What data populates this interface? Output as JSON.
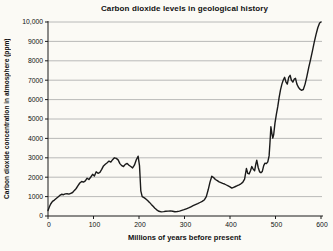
{
  "window": {
    "background": "#fbfaf5"
  },
  "chart_data": {
    "type": "line",
    "title": "Carbon dioxide levels in geological history",
    "xlabel": "Millions of years before present",
    "ylabel": "Carbon dioxide concentration in atmosphere (ppm)",
    "xlim": [
      0,
      600
    ],
    "ylim": [
      0,
      10000
    ],
    "x_ticks": [
      0,
      100,
      200,
      300,
      400,
      500,
      600
    ],
    "x_tick_labels": [
      "0",
      "100",
      "200",
      "300",
      "400",
      "500",
      "600"
    ],
    "y_ticks": [
      0,
      1000,
      2000,
      3000,
      4000,
      5000,
      6000,
      7000,
      8000,
      9000,
      10000
    ],
    "y_tick_labels": [
      "0",
      "1000",
      "2000",
      "3000",
      "4000",
      "5000",
      "6000",
      "7000",
      "8000",
      "9000",
      "10,000"
    ],
    "grid": "horizontal-only",
    "legend": "none",
    "line_color": "#1a1a1a",
    "grid_color": "#a8a8a8",
    "axis_color": "#1a1a1a",
    "text_color": "#111111",
    "series": [
      {
        "name": "CO2 concentration",
        "points": [
          [
            0,
            280
          ],
          [
            3,
            480
          ],
          [
            6,
            620
          ],
          [
            10,
            750
          ],
          [
            14,
            820
          ],
          [
            18,
            900
          ],
          [
            22,
            980
          ],
          [
            26,
            1060
          ],
          [
            30,
            1120
          ],
          [
            34,
            1100
          ],
          [
            38,
            1140
          ],
          [
            42,
            1150
          ],
          [
            46,
            1130
          ],
          [
            50,
            1170
          ],
          [
            54,
            1210
          ],
          [
            58,
            1320
          ],
          [
            62,
            1420
          ],
          [
            66,
            1560
          ],
          [
            70,
            1700
          ],
          [
            74,
            1780
          ],
          [
            78,
            1750
          ],
          [
            82,
            1810
          ],
          [
            86,
            1950
          ],
          [
            90,
            1880
          ],
          [
            94,
            2010
          ],
          [
            98,
            2150
          ],
          [
            102,
            2060
          ],
          [
            106,
            2280
          ],
          [
            110,
            2200
          ],
          [
            114,
            2250
          ],
          [
            118,
            2400
          ],
          [
            122,
            2580
          ],
          [
            126,
            2670
          ],
          [
            130,
            2750
          ],
          [
            134,
            2830
          ],
          [
            138,
            2780
          ],
          [
            142,
            2900
          ],
          [
            146,
            3000
          ],
          [
            150,
            2970
          ],
          [
            154,
            2890
          ],
          [
            158,
            2700
          ],
          [
            162,
            2600
          ],
          [
            166,
            2550
          ],
          [
            170,
            2660
          ],
          [
            174,
            2710
          ],
          [
            178,
            2620
          ],
          [
            182,
            2550
          ],
          [
            186,
            2480
          ],
          [
            190,
            2620
          ],
          [
            194,
            2900
          ],
          [
            198,
            3080
          ],
          [
            201,
            2600
          ],
          [
            204,
            1300
          ],
          [
            207,
            1000
          ],
          [
            211,
            950
          ],
          [
            215,
            880
          ],
          [
            219,
            800
          ],
          [
            223,
            700
          ],
          [
            227,
            600
          ],
          [
            231,
            500
          ],
          [
            235,
            400
          ],
          [
            239,
            320
          ],
          [
            244,
            240
          ],
          [
            249,
            210
          ],
          [
            254,
            225
          ],
          [
            259,
            245
          ],
          [
            264,
            255
          ],
          [
            269,
            265
          ],
          [
            274,
            245
          ],
          [
            279,
            220
          ],
          [
            284,
            230
          ],
          [
            289,
            255
          ],
          [
            294,
            290
          ],
          [
            299,
            325
          ],
          [
            304,
            370
          ],
          [
            309,
            420
          ],
          [
            314,
            475
          ],
          [
            319,
            530
          ],
          [
            324,
            580
          ],
          [
            329,
            635
          ],
          [
            334,
            695
          ],
          [
            339,
            755
          ],
          [
            344,
            840
          ],
          [
            348,
            1000
          ],
          [
            352,
            1350
          ],
          [
            356,
            1750
          ],
          [
            360,
            2050
          ],
          [
            364,
            1980
          ],
          [
            368,
            1880
          ],
          [
            372,
            1820
          ],
          [
            376,
            1760
          ],
          [
            380,
            1720
          ],
          [
            384,
            1680
          ],
          [
            388,
            1650
          ],
          [
            392,
            1600
          ],
          [
            396,
            1550
          ],
          [
            400,
            1500
          ],
          [
            404,
            1440
          ],
          [
            408,
            1480
          ],
          [
            412,
            1520
          ],
          [
            416,
            1560
          ],
          [
            420,
            1610
          ],
          [
            424,
            1660
          ],
          [
            428,
            1730
          ],
          [
            432,
            1900
          ],
          [
            436,
            2450
          ],
          [
            439,
            2200
          ],
          [
            442,
            2170
          ],
          [
            445,
            2330
          ],
          [
            448,
            2550
          ],
          [
            451,
            2420
          ],
          [
            454,
            2330
          ],
          [
            457,
            2700
          ],
          [
            459,
            2870
          ],
          [
            462,
            2500
          ],
          [
            465,
            2280
          ],
          [
            468,
            2230
          ],
          [
            471,
            2300
          ],
          [
            474,
            2600
          ],
          [
            477,
            2720
          ],
          [
            480,
            2700
          ],
          [
            483,
            2790
          ],
          [
            486,
            3100
          ],
          [
            488,
            3800
          ],
          [
            490,
            4600
          ],
          [
            492,
            4250
          ],
          [
            494,
            4020
          ],
          [
            496,
            4200
          ],
          [
            499,
            4800
          ],
          [
            502,
            5250
          ],
          [
            505,
            5650
          ],
          [
            508,
            6100
          ],
          [
            511,
            6500
          ],
          [
            514,
            6800
          ],
          [
            517,
            7000
          ],
          [
            520,
            7150
          ],
          [
            523,
            6900
          ],
          [
            526,
            6800
          ],
          [
            529,
            7150
          ],
          [
            532,
            7250
          ],
          [
            535,
            7000
          ],
          [
            538,
            6900
          ],
          [
            541,
            7050
          ],
          [
            544,
            7100
          ],
          [
            547,
            6800
          ],
          [
            550,
            6650
          ],
          [
            553,
            6550
          ],
          [
            557,
            6480
          ],
          [
            561,
            6520
          ],
          [
            565,
            6800
          ],
          [
            569,
            7200
          ],
          [
            573,
            7650
          ],
          [
            577,
            8050
          ],
          [
            581,
            8500
          ],
          [
            585,
            8950
          ],
          [
            589,
            9350
          ],
          [
            593,
            9700
          ],
          [
            597,
            9950
          ],
          [
            600,
            10000
          ]
        ]
      }
    ]
  }
}
